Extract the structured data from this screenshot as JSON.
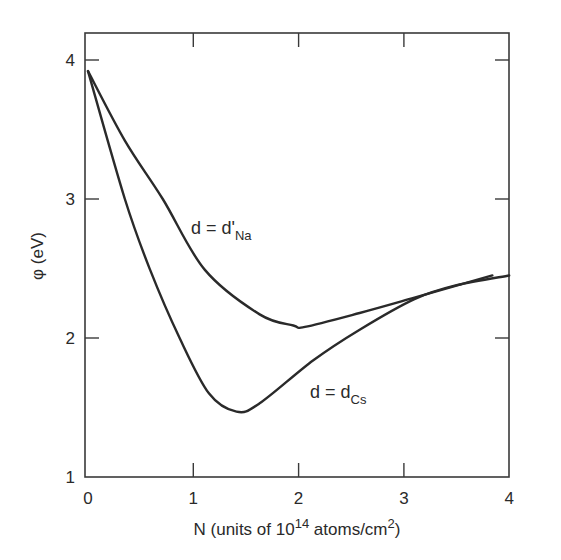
{
  "chart_data": {
    "type": "line",
    "title": "",
    "xlabel": "N (units of 10^14 atoms/cm^2)",
    "xlabel_parts": {
      "prefix": "N (units of 10",
      "sup1": "14",
      "mid": " atoms/cm",
      "sup2": "2",
      "suffix": ")"
    },
    "ylabel": "φ (eV)",
    "xlim": [
      0,
      4
    ],
    "ylim": [
      1,
      4.2
    ],
    "xticks": [
      "0",
      "1",
      "2",
      "3",
      "4"
    ],
    "yticks": [
      "1",
      "2",
      "3",
      "4"
    ],
    "grid": false,
    "legend": "none (inline curve labels)",
    "series": [
      {
        "name": "d = d'Na",
        "label_main": "d = d'",
        "label_sub": "Na",
        "x": [
          0,
          0.35,
          0.71,
          1.11,
          1.63,
          1.95,
          2.06,
          2.58,
          3.1,
          3.84
        ],
        "y": [
          3.92,
          3.42,
          3.0,
          2.49,
          2.17,
          2.09,
          2.08,
          2.18,
          2.29,
          2.45
        ]
      },
      {
        "name": "d = dCs",
        "label_main": "d = d",
        "label_sub": "Cs",
        "x": [
          0,
          0.35,
          0.59,
          0.87,
          1.15,
          1.41,
          1.63,
          2.14,
          2.58,
          3.1,
          3.5,
          4.0
        ],
        "y": [
          3.92,
          3.0,
          2.49,
          2.0,
          1.6,
          1.47,
          1.53,
          1.84,
          2.06,
          2.28,
          2.38,
          2.45
        ]
      }
    ],
    "annotations": [
      {
        "text": "d = d'Na",
        "x": 1.05,
        "y": 2.75
      },
      {
        "text": "d = dCs",
        "x": 2.22,
        "y": 1.6
      }
    ]
  },
  "colors": {
    "line": "#2a2a2a",
    "axis": "#3a3a3a",
    "background": "#ffffff"
  }
}
